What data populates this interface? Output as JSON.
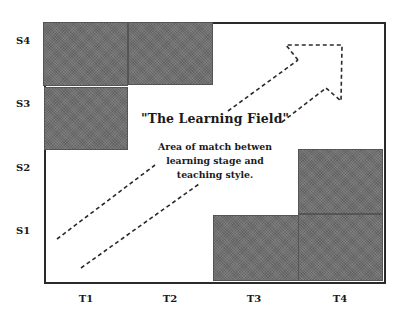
{
  "diagram": {
    "title": "\"The Learning Field\"",
    "description_lines": [
      "Area of match betwen",
      "learning stage and",
      "teaching style."
    ],
    "y_axis_labels": [
      "S4",
      "S3",
      "S2",
      "S1"
    ],
    "x_axis_labels": [
      "T1",
      "T2",
      "T3",
      "T4"
    ],
    "shaded_cells": [
      {
        "col": "T1",
        "row": "S4"
      },
      {
        "col": "T2",
        "row": "S4"
      },
      {
        "col": "T1",
        "row": "S3"
      },
      {
        "col": "T4",
        "row": "S2"
      },
      {
        "col": "T3",
        "row": "S1"
      },
      {
        "col": "T4",
        "row": "S1"
      }
    ],
    "arrow": {
      "style": "dashed",
      "direction": "diagonal-up-right"
    },
    "colors": {
      "shading": "#6f6f6f",
      "frame": "#2a2a2a",
      "text": "#1a1a1a",
      "background": "#ffffff"
    }
  }
}
